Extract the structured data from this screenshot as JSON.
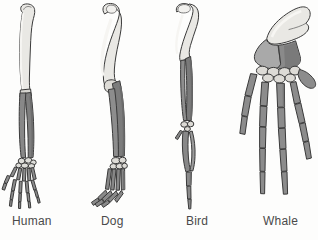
{
  "figure": {
    "background_color": "#fdfdfc"
  },
  "palette": {
    "humerus_light": "#e9e8e4",
    "humerus_shadow": "#d2d1cc",
    "forearm_dark": "#7e7e7e",
    "forearm_mid": "#8f8f8f",
    "whale_radius": "#a9a9a9",
    "whale_ulna": "#8a8a8a",
    "carpal_light": "#ddddd9",
    "digit_gray": "#8c8c8c",
    "outline": "#3a3a3a",
    "label_text": "#4a4a4a"
  },
  "specimens": [
    {
      "id": "human",
      "label": "Human",
      "label_x": 12,
      "panel_x": 0,
      "bones": [
        {
          "name": "humerus",
          "shade": "light"
        },
        {
          "name": "radius",
          "shade": "dark"
        },
        {
          "name": "ulna",
          "shade": "dark"
        },
        {
          "name": "carpals",
          "shade": "light"
        },
        {
          "name": "metacarpals",
          "shade": "dark"
        },
        {
          "name": "phalanges",
          "shade": "dark"
        }
      ]
    },
    {
      "id": "dog",
      "label": "Dog",
      "label_x": 101,
      "panel_x": 78,
      "bones": [
        {
          "name": "humerus",
          "shade": "light"
        },
        {
          "name": "radius",
          "shade": "dark"
        },
        {
          "name": "ulna",
          "shade": "dark"
        },
        {
          "name": "carpals",
          "shade": "light"
        },
        {
          "name": "metacarpals",
          "shade": "dark"
        },
        {
          "name": "phalanges",
          "shade": "dark"
        }
      ]
    },
    {
      "id": "bird",
      "label": "Bird",
      "label_x": 186,
      "panel_x": 160,
      "bones": [
        {
          "name": "humerus",
          "shade": "light"
        },
        {
          "name": "radius",
          "shade": "dark"
        },
        {
          "name": "ulna",
          "shade": "dark"
        },
        {
          "name": "carpals",
          "shade": "light"
        },
        {
          "name": "metacarpals",
          "shade": "dark"
        },
        {
          "name": "phalanges",
          "shade": "dark"
        }
      ]
    },
    {
      "id": "whale",
      "label": "Whale",
      "label_x": 263,
      "panel_x": 224,
      "bones": [
        {
          "name": "humerus",
          "shade": "light"
        },
        {
          "name": "radius",
          "shade": "mid"
        },
        {
          "name": "ulna",
          "shade": "dark"
        },
        {
          "name": "carpals",
          "shade": "light"
        },
        {
          "name": "metacarpals",
          "shade": "dark"
        },
        {
          "name": "phalanges",
          "shade": "dark"
        }
      ]
    }
  ]
}
